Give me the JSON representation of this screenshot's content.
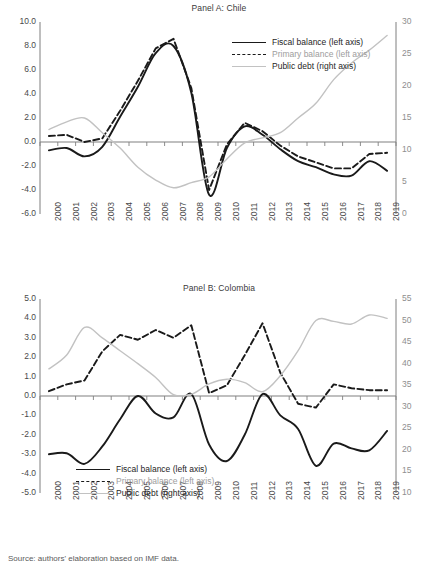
{
  "figure": {
    "caption": "Source: authors' elaboration based on IMF data."
  },
  "legend": {
    "fiscal": "Fiscal balance (left axis)",
    "primary": "Primary balance (left axis)",
    "debt": "Public debt (right axis)"
  },
  "colors": {
    "fiscal": "#1a1a1a",
    "primary": "#1a1a1a",
    "debt": "#c2c2c2",
    "axis": "#7f7f7f",
    "tick_text": "#4a4a4a",
    "right_tick_text": "#8e8e8e"
  },
  "chart_data": [
    {
      "type": "line",
      "title": "Panel A: Chile",
      "xlabel": "",
      "ylabel": "",
      "x": [
        2000,
        2001,
        2002,
        2003,
        2004,
        2005,
        2006,
        2007,
        2008,
        2009,
        2010,
        2011,
        2012,
        2013,
        2014,
        2015,
        2016,
        2017,
        2018,
        2019
      ],
      "xtick_labels": [
        "2000",
        "2001",
        "2002",
        "2003",
        "2004",
        "2005",
        "2006",
        "2007",
        "2008",
        "2009",
        "2010",
        "2011",
        "2012",
        "2013",
        "2014",
        "2015",
        "2016",
        "2017",
        "2018",
        "2019"
      ],
      "left_axis": {
        "ylim": [
          -6.0,
          10.0
        ],
        "ticks": [
          10.0,
          8.0,
          6.0,
          4.0,
          2.0,
          0.0,
          -2.0,
          -4.0,
          -6.0
        ],
        "tick_labels": [
          "10.0",
          "8.0",
          "6.0",
          "4.0",
          "2.0",
          "0.0",
          "-2.0",
          "-4.0",
          "-6.0"
        ]
      },
      "right_axis": {
        "ylim": [
          0,
          30
        ],
        "ticks": [
          30,
          25,
          20,
          15,
          10,
          5,
          0
        ],
        "tick_labels": [
          "30",
          "25",
          "20",
          "15",
          "10",
          "5",
          "0"
        ]
      },
      "grid": false,
      "legend_position": "top-right",
      "series": [
        {
          "name": "Fiscal balance (left axis)",
          "axis": "left",
          "style": "solid",
          "color": "#1a1a1a",
          "values": [
            -0.7,
            -0.5,
            -1.2,
            -0.4,
            2.1,
            4.6,
            7.4,
            8.0,
            4.1,
            -4.4,
            -0.5,
            1.3,
            0.6,
            -0.6,
            -1.6,
            -2.1,
            -2.7,
            -2.8,
            -1.6,
            -2.4
          ]
        },
        {
          "name": "Primary balance (left axis)",
          "axis": "left",
          "style": "dashed",
          "color": "#1a1a1a",
          "values": [
            0.5,
            0.6,
            0.0,
            0.3,
            2.6,
            5.1,
            7.8,
            8.6,
            4.5,
            -4.0,
            -0.2,
            1.6,
            0.9,
            -0.3,
            -1.2,
            -1.7,
            -2.2,
            -2.2,
            -1.0,
            -0.9
          ]
        },
        {
          "name": "Public debt (right axis)",
          "axis": "right",
          "style": "light",
          "color": "#c2c2c2",
          "values": [
            13.2,
            14.4,
            15.0,
            12.7,
            10.3,
            7.3,
            5.3,
            4.1,
            4.9,
            5.8,
            8.6,
            11.1,
            11.9,
            12.7,
            15.0,
            17.3,
            21.0,
            23.6,
            25.6,
            27.9
          ]
        }
      ]
    },
    {
      "type": "line",
      "title": "Panel B: Colombia",
      "xlabel": "",
      "ylabel": "",
      "x": [
        2000,
        2001,
        2002,
        2003,
        2004,
        2005,
        2006,
        2007,
        2008,
        2009,
        2010,
        2011,
        2012,
        2013,
        2014,
        2015,
        2016,
        2017,
        2018,
        2019
      ],
      "xtick_labels": [
        "2000",
        "2001",
        "2002",
        "2003",
        "2004",
        "2005",
        "2006",
        "2007",
        "2008",
        "2009",
        "2010",
        "2011",
        "2012",
        "2013",
        "2014",
        "2015",
        "2016",
        "2017",
        "2018",
        "2019"
      ],
      "left_axis": {
        "ylim": [
          -5.0,
          5.0
        ],
        "ticks": [
          5.0,
          4.0,
          3.0,
          2.0,
          1.0,
          0.0,
          -1.0,
          -2.0,
          -3.0,
          -4.0,
          -5.0
        ],
        "tick_labels": [
          "5.0",
          "4.0",
          "3.0",
          "2.0",
          "1.0",
          "0.0",
          "-1.0",
          "-2.0",
          "-3.0",
          "-4.0",
          "-5.0"
        ]
      },
      "right_axis": {
        "ylim": [
          10,
          55
        ],
        "ticks": [
          55,
          50,
          45,
          40,
          35,
          30,
          25,
          20,
          15,
          10
        ],
        "tick_labels": [
          "55",
          "50",
          "45",
          "40",
          "35",
          "30",
          "25",
          "20",
          "15",
          "10"
        ]
      },
      "grid": false,
      "legend_position": "bottom-center",
      "series": [
        {
          "name": "Fiscal balance (left axis)",
          "axis": "left",
          "style": "solid",
          "color": "#1a1a1a",
          "values": [
            -3.0,
            -2.95,
            -3.5,
            -2.6,
            -1.2,
            0.0,
            -0.9,
            -1.1,
            0.1,
            -2.5,
            -3.35,
            -2.0,
            0.1,
            -1.0,
            -1.7,
            -3.6,
            -2.45,
            -2.7,
            -2.8,
            -1.8
          ]
        },
        {
          "name": "Primary balance (left axis)",
          "axis": "left",
          "style": "dashed",
          "color": "#1a1a1a",
          "values": [
            0.25,
            0.6,
            0.8,
            2.3,
            3.15,
            2.9,
            3.4,
            3.0,
            3.65,
            0.15,
            0.55,
            2.1,
            3.75,
            1.2,
            -0.4,
            -0.6,
            0.6,
            0.4,
            0.3,
            0.3
          ]
        },
        {
          "name": "Public debt (right axis)",
          "axis": "right",
          "style": "light",
          "color": "#c2c2c2",
          "values": [
            38.8,
            42.0,
            48.4,
            46.0,
            43.0,
            40.0,
            36.8,
            32.8,
            32.9,
            35.3,
            36.4,
            35.6,
            33.5,
            37.2,
            43.0,
            50.0,
            49.8,
            49.2,
            51.3,
            50.5
          ]
        }
      ]
    }
  ]
}
